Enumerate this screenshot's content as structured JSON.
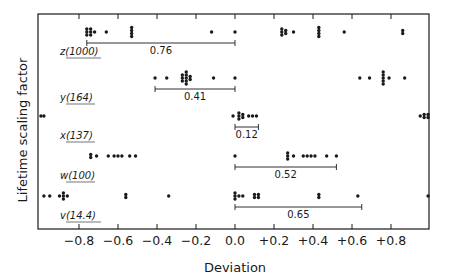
{
  "chart_data": {
    "type": "scatter",
    "title": "",
    "xlabel": "Deviation",
    "ylabel": "Lifetime scaling factor",
    "xlim": [
      -1.0,
      1.0
    ],
    "grid": false,
    "legend": null,
    "x_ticks": [
      -0.8,
      -0.6,
      -0.4,
      -0.2,
      0.0,
      0.2,
      0.4,
      0.6,
      0.8
    ],
    "x_tick_labels": [
      "-0.8",
      "-0.6",
      "-0.4",
      "-0.2",
      "0.0",
      "+0.2",
      "+0.4",
      "+0.6",
      "+0.8"
    ],
    "series": [
      {
        "name": "z(1000)",
        "label_var": "z",
        "label_val": "(1000)",
        "range_label": "0.76",
        "range": [
          -0.76,
          0.0
        ],
        "points": [
          {
            "x": -0.76,
            "n": 3
          },
          {
            "x": -0.74,
            "n": 3
          },
          {
            "x": -0.72,
            "n": 1
          },
          {
            "x": -0.66,
            "n": 1
          },
          {
            "x": -0.53,
            "n": 4
          },
          {
            "x": -0.12,
            "n": 1
          },
          {
            "x": 0.0,
            "n": 1
          },
          {
            "x": 0.24,
            "n": 3
          },
          {
            "x": 0.26,
            "n": 2
          },
          {
            "x": 0.3,
            "n": 1
          },
          {
            "x": 0.43,
            "n": 4
          },
          {
            "x": 0.56,
            "n": 1
          },
          {
            "x": 0.86,
            "n": 2
          }
        ]
      },
      {
        "name": "y(164)",
        "label_var": "y",
        "label_val": "(164)",
        "range_label": "0.41",
        "range": [
          -0.41,
          0.0
        ],
        "points": [
          {
            "x": -0.41,
            "n": 1
          },
          {
            "x": -0.35,
            "n": 1
          },
          {
            "x": -0.27,
            "n": 3
          },
          {
            "x": -0.25,
            "n": 5
          },
          {
            "x": -0.23,
            "n": 2
          },
          {
            "x": -0.11,
            "n": 1
          },
          {
            "x": 0.0,
            "n": 1
          },
          {
            "x": 0.64,
            "n": 1
          },
          {
            "x": 0.69,
            "n": 1
          },
          {
            "x": 0.76,
            "n": 5
          },
          {
            "x": 0.79,
            "n": 1
          },
          {
            "x": 0.87,
            "n": 1
          }
        ]
      },
      {
        "name": "x(137)",
        "label_var": "x",
        "label_val": "(137)",
        "range_label": "0.12",
        "range": [
          0.0,
          0.12
        ],
        "points": [
          {
            "x": -0.995,
            "n": 1
          },
          {
            "x": -0.98,
            "n": 1
          },
          {
            "x": -0.01,
            "n": 1
          },
          {
            "x": 0.02,
            "n": 3
          },
          {
            "x": 0.04,
            "n": 2
          },
          {
            "x": 0.07,
            "n": 1
          },
          {
            "x": 0.09,
            "n": 1
          },
          {
            "x": 0.11,
            "n": 1
          },
          {
            "x": 0.95,
            "n": 1
          },
          {
            "x": 0.97,
            "n": 2
          },
          {
            "x": 0.99,
            "n": 2
          }
        ]
      },
      {
        "name": "w(100)",
        "label_var": "w",
        "label_val": "(100)",
        "range_label": "0.52",
        "range": [
          0.0,
          0.52
        ],
        "points": [
          {
            "x": -0.74,
            "n": 2
          },
          {
            "x": -0.71,
            "n": 1
          },
          {
            "x": -0.65,
            "n": 1
          },
          {
            "x": -0.62,
            "n": 1
          },
          {
            "x": -0.6,
            "n": 1
          },
          {
            "x": -0.58,
            "n": 1
          },
          {
            "x": -0.54,
            "n": 1
          },
          {
            "x": -0.51,
            "n": 1
          },
          {
            "x": 0.0,
            "n": 1
          },
          {
            "x": 0.27,
            "n": 3
          },
          {
            "x": 0.3,
            "n": 1
          },
          {
            "x": 0.35,
            "n": 1
          },
          {
            "x": 0.37,
            "n": 1
          },
          {
            "x": 0.39,
            "n": 1
          },
          {
            "x": 0.41,
            "n": 1
          },
          {
            "x": 0.47,
            "n": 1
          },
          {
            "x": 0.52,
            "n": 1
          }
        ]
      },
      {
        "name": "v(14.4)",
        "label_var": "v",
        "label_val": "(14.4)",
        "range_label": "0.65",
        "range": [
          0.0,
          0.65
        ],
        "points": [
          {
            "x": -0.98,
            "n": 1
          },
          {
            "x": -0.95,
            "n": 1
          },
          {
            "x": -0.9,
            "n": 1
          },
          {
            "x": -0.88,
            "n": 3
          },
          {
            "x": -0.86,
            "n": 1
          },
          {
            "x": -0.56,
            "n": 2
          },
          {
            "x": -0.34,
            "n": 1
          },
          {
            "x": 0.0,
            "n": 3
          },
          {
            "x": 0.02,
            "n": 1
          },
          {
            "x": 0.04,
            "n": 1
          },
          {
            "x": 0.1,
            "n": 2
          },
          {
            "x": 0.12,
            "n": 2
          },
          {
            "x": 0.43,
            "n": 2
          },
          {
            "x": 0.63,
            "n": 1
          },
          {
            "x": 0.99,
            "n": 1
          }
        ]
      }
    ]
  }
}
